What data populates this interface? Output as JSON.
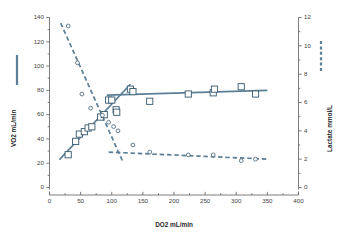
{
  "chart_data": {
    "type": "scatter",
    "title": "",
    "xlabel": "DO2 mL/min",
    "ylabel": "VO2 mL/min",
    "y2label": "Lactate mmol/L",
    "xlim": [
      0,
      400
    ],
    "ylim": [
      0,
      140
    ],
    "y2lim": [
      0,
      12
    ],
    "xticks": [
      0,
      50,
      100,
      150,
      200,
      250,
      300,
      350,
      400
    ],
    "yticks": [
      0,
      20,
      40,
      60,
      80,
      100,
      120,
      140
    ],
    "y2ticks": [
      0,
      2,
      4,
      6,
      8,
      10,
      12
    ],
    "xminor_step": 25,
    "yminor_step": 10,
    "y2minor_step": 1,
    "grid": false,
    "legend_position": "outside-left-and-right",
    "accent_color": "#5b7f96",
    "marker_color": "#3f5f73",
    "axis_color": "#6e6e6e",
    "series": [
      {
        "name": "VO2",
        "axis": "left",
        "marker": "open-square",
        "line_style": "solid",
        "points": [
          {
            "x": 30,
            "y": 27
          },
          {
            "x": 42,
            "y": 38
          },
          {
            "x": 48,
            "y": 44
          },
          {
            "x": 56,
            "y": 46
          },
          {
            "x": 62,
            "y": 49
          },
          {
            "x": 68,
            "y": 50
          },
          {
            "x": 82,
            "y": 58
          },
          {
            "x": 88,
            "y": 60
          },
          {
            "x": 95,
            "y": 72
          },
          {
            "x": 100,
            "y": 72
          },
          {
            "x": 107,
            "y": 64
          },
          {
            "x": 108,
            "y": 62
          },
          {
            "x": 130,
            "y": 81
          },
          {
            "x": 134,
            "y": 79
          },
          {
            "x": 161,
            "y": 71
          },
          {
            "x": 223,
            "y": 77
          },
          {
            "x": 263,
            "y": 78
          },
          {
            "x": 265,
            "y": 81
          },
          {
            "x": 308,
            "y": 83
          },
          {
            "x": 331,
            "y": 77
          }
        ],
        "fit_segments": [
          {
            "x1": 16,
            "y1": 23,
            "x2": 130,
            "y2": 85
          },
          {
            "x1": 92,
            "y1": 76,
            "x2": 350,
            "y2": 80
          }
        ]
      },
      {
        "name": "Lactate",
        "axis": "right",
        "marker": "open-circle",
        "line_style": "dashed",
        "points": [
          {
            "x": 30,
            "y": 11.4
          },
          {
            "x": 45,
            "y": 8.8
          },
          {
            "x": 52,
            "y": 6.6
          },
          {
            "x": 66,
            "y": 5.6
          },
          {
            "x": 85,
            "y": 5.1
          },
          {
            "x": 95,
            "y": 4.6
          },
          {
            "x": 103,
            "y": 4.3
          },
          {
            "x": 110,
            "y": 4.0
          },
          {
            "x": 134,
            "y": 3.0
          },
          {
            "x": 161,
            "y": 2.5
          },
          {
            "x": 223,
            "y": 2.3
          },
          {
            "x": 263,
            "y": 2.3
          },
          {
            "x": 308,
            "y": 1.9
          },
          {
            "x": 331,
            "y": 2.0
          }
        ],
        "fit_segments": [
          {
            "x1": 18,
            "y1": 11.6,
            "x2": 118,
            "y2": 1.8
          },
          {
            "x1": 95,
            "y1": 2.5,
            "x2": 350,
            "y2": 2.0
          }
        ]
      }
    ],
    "legend": [
      {
        "label": "",
        "style": "solid",
        "color": "#5b7f96",
        "axis": "left"
      },
      {
        "label": "",
        "style": "dashed",
        "color": "#5b7f96",
        "axis": "right"
      }
    ]
  }
}
